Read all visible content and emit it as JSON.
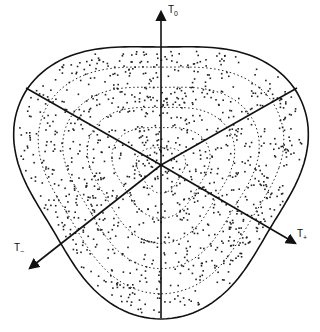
{
  "diagram": {
    "type": "dalitz-plot",
    "center": [
      161,
      165
    ],
    "axes": [
      {
        "id": "t0",
        "label": "T",
        "subscript": "0",
        "direction": "up"
      },
      {
        "id": "t-plus",
        "label": "T",
        "subscript": "+",
        "direction": "lower-right"
      },
      {
        "id": "t-minus",
        "label": "T",
        "subscript": "−",
        "direction": "lower-left"
      }
    ],
    "contour_count": 5,
    "colors": {
      "line": "#111111",
      "dot": "#222222",
      "background": "#ffffff"
    }
  }
}
